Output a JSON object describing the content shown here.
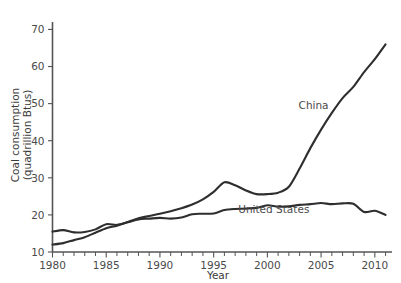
{
  "chart_data": {
    "type": "line",
    "title": "",
    "xlabel": "Year",
    "ylabel": "Coal consumption\n(quadrillion Btus)",
    "ylabel_line1": "Coal consumption",
    "ylabel_line2": "(quadrillion Btus)",
    "xlim": [
      1980,
      2011.6
    ],
    "ylim": [
      10,
      72
    ],
    "grid": false,
    "legend_position": "inline-annotations",
    "yticks": [
      10,
      20,
      30,
      40,
      50,
      60,
      70
    ],
    "ytick_labels": [
      "10",
      "20",
      "30",
      "40",
      "50",
      "60",
      "70"
    ],
    "xticks": [
      1980,
      1985,
      1990,
      1995,
      2000,
      2005,
      2010
    ],
    "xtick_labels": [
      "1980",
      "1985",
      "1990",
      "1995",
      "2000",
      "2005",
      "2010"
    ],
    "xminor_step": 1,
    "x": [
      1980,
      1981,
      1982,
      1983,
      1984,
      1985,
      1986,
      1987,
      1988,
      1989,
      1990,
      1991,
      1992,
      1993,
      1994,
      1995,
      1996,
      1997,
      1998,
      1999,
      2000,
      2001,
      2002,
      2003,
      2004,
      2005,
      2006,
      2007,
      2008,
      2009,
      2010,
      2011
    ],
    "series": [
      {
        "name": "China",
        "color": "#2e2e2e",
        "label_x": 2004.3,
        "label_y": 48.5,
        "values": [
          12.0,
          12.4,
          13.2,
          14.0,
          15.2,
          16.4,
          17.1,
          18.1,
          19.1,
          19.7,
          20.3,
          21.0,
          21.8,
          22.8,
          24.2,
          26.2,
          28.8,
          28.0,
          26.6,
          25.6,
          25.6,
          26.0,
          27.6,
          32.5,
          38.0,
          43.0,
          47.5,
          51.5,
          54.5,
          58.5,
          62.0,
          66.0
        ]
      },
      {
        "name": "United States",
        "color": "#2e2e2e",
        "label_x": 2000.6,
        "label_y": 20.6,
        "values": [
          15.5,
          15.9,
          15.3,
          15.4,
          16.1,
          17.5,
          17.3,
          18.0,
          18.8,
          19.0,
          19.2,
          19.0,
          19.3,
          20.2,
          20.3,
          20.4,
          21.3,
          21.6,
          21.7,
          21.9,
          22.6,
          22.2,
          22.3,
          22.7,
          22.9,
          23.2,
          22.9,
          23.1,
          23.0,
          20.8,
          21.1,
          20.0
        ]
      }
    ]
  }
}
